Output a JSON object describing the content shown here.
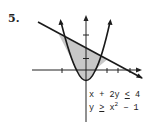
{
  "problem": {
    "number": "5.",
    "inequalities": [
      {
        "lhs": "x + 2y",
        "op": "<",
        "rhs": "4"
      },
      {
        "lhs": "y",
        "op": ">",
        "rhs_base": "x",
        "rhs_exp": "2",
        "rhs_tail": " − 1"
      }
    ]
  },
  "graph": {
    "origin_px": [
      86,
      70
    ],
    "unit_px": 11.5,
    "x_ticks": [
      -2,
      2,
      3,
      4
    ],
    "y_ticks": [
      1,
      3
    ],
    "line": "x + 2y = 4",
    "parabola": "y = x^2 - 1",
    "shaded_region": "between parabola and line, x from about -2.4 to 1.8",
    "colors": {
      "axis": "#222222",
      "curve": "#1a1a1a",
      "shade": "#c8c8c8"
    }
  }
}
